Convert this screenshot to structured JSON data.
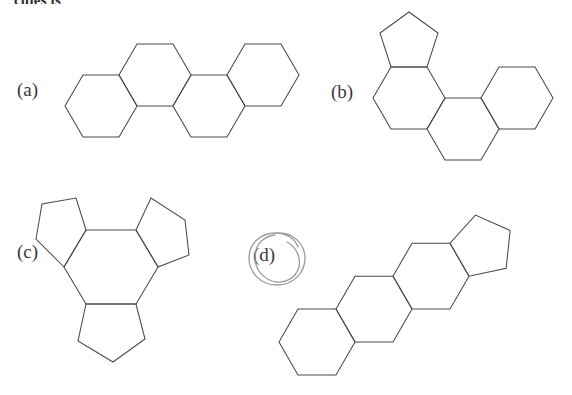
{
  "page": {
    "background_color": "#ffffff",
    "stroke_color": "#4a4a4a",
    "text_color": "#3a3a3a",
    "ink_color": "#9a9a9a",
    "width": 572,
    "height": 395
  },
  "header": {
    "partial_text": "cules is"
  },
  "options": [
    {
      "id": "a",
      "label": "(a)",
      "structure_name": "four-fused-hexagon-zigzag",
      "ring_count": 4,
      "ring_sizes": [
        6,
        6,
        6,
        6
      ],
      "selected": false
    },
    {
      "id": "b",
      "label": "(b)",
      "structure_name": "three-hexagon-one-pentagon-angular",
      "ring_count": 4,
      "ring_sizes": [
        5,
        6,
        6,
        6
      ],
      "selected": false
    },
    {
      "id": "c",
      "label": "(c)",
      "structure_name": "central-hexagon-three-fused-pentagons",
      "ring_count": 4,
      "ring_sizes": [
        6,
        5,
        5,
        5
      ],
      "selected": false
    },
    {
      "id": "d",
      "label": "(d)",
      "structure_name": "steroid-skeleton-three-hexagons-one-pentagon",
      "ring_count": 4,
      "ring_sizes": [
        6,
        6,
        6,
        5
      ],
      "selected": true
    }
  ],
  "annotation": {
    "type": "hand-drawn-ellipse",
    "target": "(d)",
    "color": "#9a9a9a"
  }
}
